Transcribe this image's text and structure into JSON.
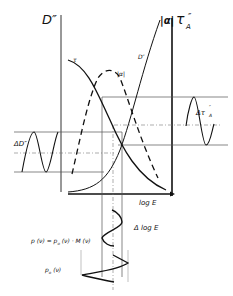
{
  "diagram": {
    "axes": {
      "left_axis_label": "D″",
      "alpha_axis_label": "|α|",
      "right_axis_label": "τ",
      "right_axis_subscript": "A",
      "right_axis_sup": "″",
      "x_axis_label": "log E"
    },
    "curves": {
      "tau_label": "τ",
      "tau_sub": "A",
      "tau_sup": "″",
      "alpha_label": "|α|",
      "d_label": "D″"
    },
    "annotations": {
      "delta_d": "ΔD″",
      "delta_tau": "Δτ",
      "delta_tau_sub": "A",
      "delta_tau_sup": "″",
      "delta_log_e": "Δ log E",
      "p_formula": "p (ν) = p",
      "p_formula_sub": "o",
      "p_formula_rest": " (ν) · M (ν)",
      "p0_label": "p",
      "p0_sub": "o",
      "p0_rest": " (ν)"
    },
    "colors": {
      "ink": "#111111",
      "thin": "#555555",
      "background": "#ffffff"
    }
  }
}
